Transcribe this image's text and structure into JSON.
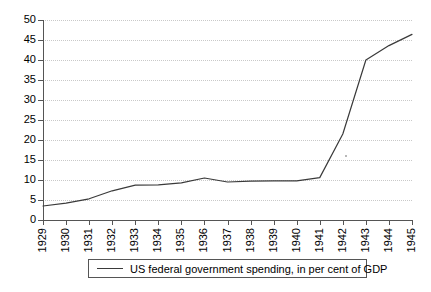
{
  "chart_data": {
    "type": "line",
    "title": "",
    "subtitle": "",
    "xlabel": "",
    "ylabel": "",
    "grid": true,
    "legend_position": "bottom",
    "xlim": [
      1929,
      1945
    ],
    "ylim": [
      0,
      50
    ],
    "ytick_step": 5,
    "categories": [
      "1929",
      "1930",
      "1931",
      "1932",
      "1933",
      "1934",
      "1935",
      "1936",
      "1937",
      "1938",
      "1939",
      "1940",
      "1941",
      "1942",
      "1943",
      "1944",
      "1945"
    ],
    "ytick_labels": [
      "0",
      "5",
      "10",
      "15",
      "20",
      "25",
      "30",
      "35",
      "40",
      "45",
      "50"
    ],
    "series": [
      {
        "name": "US federal government spending, in per cent of GDP",
        "color": "#3a3a3a",
        "values": [
          3.5,
          4.2,
          5.3,
          7.3,
          8.7,
          8.8,
          9.3,
          10.5,
          9.5,
          9.7,
          9.8,
          9.8,
          10.6,
          21.5,
          40.0,
          43.6,
          46.4
        ]
      }
    ]
  },
  "axis": {
    "y_axis_name": "value-axis",
    "x_axis_name": "year-axis"
  },
  "legend": {
    "entries": [
      {
        "label": "US federal government spending, in per cent of GDP",
        "color": "#3a3a3a"
      }
    ]
  }
}
